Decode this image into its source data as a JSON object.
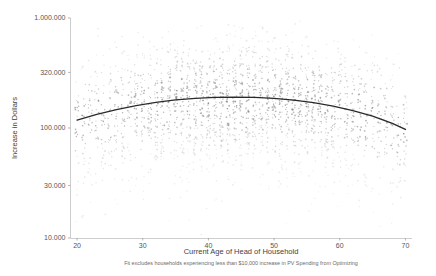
{
  "chart_data": {
    "type": "scatter",
    "title": "",
    "xlabel": "Current Age of Head of Household",
    "ylabel": "Increase in Dollars",
    "footnote": "Fit excludes households experiencing less than $10,000 increase in PV Spending from Optimizing",
    "xlim": [
      19,
      71
    ],
    "ylim": [
      10000,
      1000000
    ],
    "yscale": "log",
    "xscale": "linear",
    "grid": false,
    "legend": null,
    "xticks": [
      20,
      30,
      40,
      50,
      60,
      70
    ],
    "xtick_labels": [
      "20",
      "30",
      "40",
      "50",
      "60",
      "70"
    ],
    "yticks": [
      10000,
      30000,
      100000,
      320000,
      1000000
    ],
    "ytick_labels": [
      "10.000",
      "30.000",
      "100.000",
      "320.000",
      "1.000.000"
    ],
    "marker_color": "#7b7b7b",
    "fit_color": "#2a2a2a",
    "axis_color": "#b9b9b9",
    "fit_curve": {
      "description": "quadratic fit in log-dollars, peak near age 46",
      "x": [
        20,
        23,
        26,
        29,
        32,
        35,
        38,
        41,
        44,
        47,
        50,
        53,
        56,
        59,
        62,
        65,
        68,
        70
      ],
      "y": [
        118000,
        133000,
        147000,
        160000,
        171000,
        180000,
        186000,
        190000,
        191000,
        190000,
        186000,
        179000,
        170000,
        158000,
        144000,
        128000,
        110000,
        97000
      ]
    },
    "scatter_summary": {
      "n_points_approx": 2400,
      "x_range_observed": [
        20,
        70
      ],
      "y_range_observed": [
        10000,
        900000
      ],
      "pattern": "vertical stripes at integer ages; density greatest between 30 and 62 and between 60.000 and 400.000 dollars"
    }
  },
  "axes": {
    "y_title": "Increase in Dollars",
    "x_title": "Current Age of Head of Household"
  }
}
